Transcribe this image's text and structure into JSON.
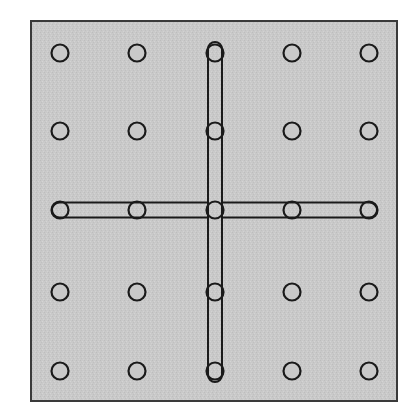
{
  "figure": {
    "canvas": {
      "width": 416,
      "height": 418,
      "background_color": "#ffffff"
    },
    "board": {
      "name": "pegboard",
      "x": 30,
      "y": 20,
      "width": 368,
      "height": 382,
      "fill_color": "#c9c9c9",
      "stroke_color": "#3a3a3a",
      "stroke_width": 2,
      "texture": "stippled-gray"
    },
    "grid": {
      "rows": 5,
      "columns": 5,
      "column_x": [
        60,
        137,
        215,
        292,
        369
      ],
      "row_y": [
        53,
        131,
        210,
        292,
        371
      ],
      "hole_radius": 8.5,
      "hole_fill_color": "#c9c9c9",
      "hole_stroke_color": "#1a1a1a",
      "hole_stroke_width": 2.2
    },
    "bars": [
      {
        "name": "horizontal-bar",
        "orientation": "horizontal",
        "from_column": 1,
        "to_column": 5,
        "row": 3,
        "x1": 60,
        "y1": 210,
        "x2": 369,
        "y2": 210,
        "thickness": 15,
        "fill_color": "#c9c9c9",
        "stroke_color": "#1a1a1a",
        "stroke_width": 2,
        "cap": "round"
      },
      {
        "name": "vertical-bar",
        "orientation": "vertical",
        "column": 3,
        "from_row": 1,
        "to_row": 5,
        "x1": 215,
        "y1": 53,
        "x2": 215,
        "y2": 371,
        "thickness": 14,
        "fill_color": "#c9c9c9",
        "stroke_color": "#1a1a1a",
        "stroke_width": 2,
        "cap": "round"
      }
    ],
    "holes": [
      {
        "id": "hole-r1c1",
        "row": 1,
        "col": 1,
        "cx": 60,
        "cy": 53,
        "occupied": false
      },
      {
        "id": "hole-r1c2",
        "row": 1,
        "col": 2,
        "cx": 137,
        "cy": 53,
        "occupied": false
      },
      {
        "id": "hole-r1c3",
        "row": 1,
        "col": 3,
        "cx": 215,
        "cy": 53,
        "occupied": true
      },
      {
        "id": "hole-r1c4",
        "row": 1,
        "col": 4,
        "cx": 292,
        "cy": 53,
        "occupied": false
      },
      {
        "id": "hole-r1c5",
        "row": 1,
        "col": 5,
        "cx": 369,
        "cy": 53,
        "occupied": false
      },
      {
        "id": "hole-r2c1",
        "row": 2,
        "col": 1,
        "cx": 60,
        "cy": 131,
        "occupied": false
      },
      {
        "id": "hole-r2c2",
        "row": 2,
        "col": 2,
        "cx": 137,
        "cy": 131,
        "occupied": false
      },
      {
        "id": "hole-r2c3",
        "row": 2,
        "col": 3,
        "cx": 215,
        "cy": 131,
        "occupied": true
      },
      {
        "id": "hole-r2c4",
        "row": 2,
        "col": 4,
        "cx": 292,
        "cy": 131,
        "occupied": false
      },
      {
        "id": "hole-r2c5",
        "row": 2,
        "col": 5,
        "cx": 369,
        "cy": 131,
        "occupied": false
      },
      {
        "id": "hole-r3c1",
        "row": 3,
        "col": 1,
        "cx": 60,
        "cy": 210,
        "occupied": true
      },
      {
        "id": "hole-r3c2",
        "row": 3,
        "col": 2,
        "cx": 137,
        "cy": 210,
        "occupied": true
      },
      {
        "id": "hole-r3c3",
        "row": 3,
        "col": 3,
        "cx": 215,
        "cy": 210,
        "occupied": true
      },
      {
        "id": "hole-r3c4",
        "row": 3,
        "col": 4,
        "cx": 292,
        "cy": 210,
        "occupied": true
      },
      {
        "id": "hole-r3c5",
        "row": 3,
        "col": 5,
        "cx": 369,
        "cy": 210,
        "occupied": true
      },
      {
        "id": "hole-r4c1",
        "row": 4,
        "col": 1,
        "cx": 60,
        "cy": 292,
        "occupied": false
      },
      {
        "id": "hole-r4c2",
        "row": 4,
        "col": 2,
        "cx": 137,
        "cy": 292,
        "occupied": false
      },
      {
        "id": "hole-r4c3",
        "row": 4,
        "col": 3,
        "cx": 215,
        "cy": 292,
        "occupied": true
      },
      {
        "id": "hole-r4c4",
        "row": 4,
        "col": 4,
        "cx": 292,
        "cy": 292,
        "occupied": false
      },
      {
        "id": "hole-r4c5",
        "row": 4,
        "col": 5,
        "cx": 369,
        "cy": 292,
        "occupied": false
      },
      {
        "id": "hole-r5c1",
        "row": 5,
        "col": 1,
        "cx": 60,
        "cy": 371,
        "occupied": false
      },
      {
        "id": "hole-r5c2",
        "row": 5,
        "col": 2,
        "cx": 137,
        "cy": 371,
        "occupied": false
      },
      {
        "id": "hole-r5c3",
        "row": 5,
        "col": 3,
        "cx": 215,
        "cy": 371,
        "occupied": true
      },
      {
        "id": "hole-r5c4",
        "row": 5,
        "col": 4,
        "cx": 292,
        "cy": 371,
        "occupied": false
      },
      {
        "id": "hole-r5c5",
        "row": 5,
        "col": 5,
        "cx": 369,
        "cy": 371,
        "occupied": false
      }
    ]
  }
}
